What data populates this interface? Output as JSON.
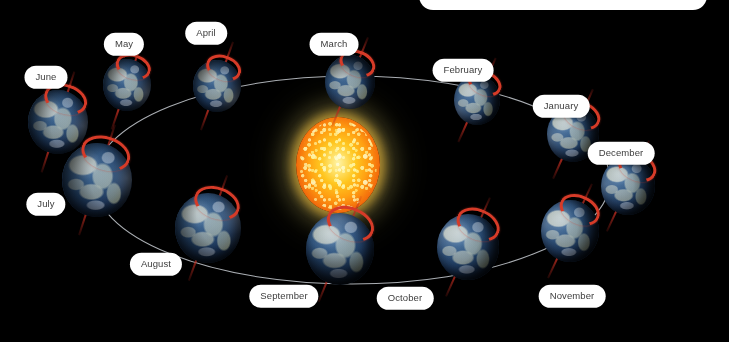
{
  "diagram": {
    "background_color": "#000000",
    "orbit_color": "#c8ccd2",
    "label_bg_color": "#ffffff",
    "label_text_color": "#3c3c3c",
    "axis_tilt_color": "#b22a1e",
    "polar_cap_color": "#d63b28",
    "sun": {
      "name": "Sun",
      "core_color": "#ffc61f",
      "rim_color": "#d94f08",
      "glow_color": "#e8e09a",
      "cx": 338,
      "cy": 165,
      "rx": 42,
      "ry": 48
    },
    "orbit": {
      "cx": 352,
      "cy": 180,
      "rx": 258,
      "ry": 104
    },
    "top_panel": {
      "text": ""
    },
    "months": [
      {
        "label": "January",
        "earth_x": 573,
        "earth_y": 134,
        "earth_r": 26,
        "tilt": 24,
        "label_x": 561,
        "label_y": 106
      },
      {
        "label": "February",
        "earth_x": 477,
        "earth_y": 100,
        "earth_r": 23,
        "tilt": 24,
        "label_x": 463,
        "label_y": 70
      },
      {
        "label": "March",
        "earth_x": 350,
        "earth_y": 82,
        "earth_r": 25,
        "tilt": 22,
        "label_x": 334,
        "label_y": 44
      },
      {
        "label": "April",
        "earth_x": 217,
        "earth_y": 86,
        "earth_r": 24,
        "tilt": 20,
        "label_x": 206,
        "label_y": 33
      },
      {
        "label": "May",
        "earth_x": 127,
        "earth_y": 85,
        "earth_r": 24,
        "tilt": 19,
        "label_x": 124,
        "label_y": 44
      },
      {
        "label": "June",
        "earth_x": 58,
        "earth_y": 122,
        "earth_r": 30,
        "tilt": 18,
        "label_x": 46,
        "label_y": 77
      },
      {
        "label": "July",
        "earth_x": 97,
        "earth_y": 180,
        "earth_r": 35,
        "tilt": 18,
        "label_x": 46,
        "label_y": 204
      },
      {
        "label": "August",
        "earth_x": 208,
        "earth_y": 228,
        "earth_r": 33,
        "tilt": 20,
        "label_x": 156,
        "label_y": 264
      },
      {
        "label": "September",
        "earth_x": 340,
        "earth_y": 249,
        "earth_r": 34,
        "tilt": 22,
        "label_x": 284,
        "label_y": 296
      },
      {
        "label": "October",
        "earth_x": 468,
        "earth_y": 247,
        "earth_r": 31,
        "tilt": 24,
        "label_x": 405,
        "label_y": 298
      },
      {
        "label": "November",
        "earth_x": 570,
        "earth_y": 231,
        "earth_r": 29,
        "tilt": 25,
        "label_x": 572,
        "label_y": 296
      },
      {
        "label": "December",
        "earth_x": 628,
        "earth_y": 186,
        "earth_r": 27,
        "tilt": 25,
        "label_x": 621,
        "label_y": 153
      }
    ]
  }
}
